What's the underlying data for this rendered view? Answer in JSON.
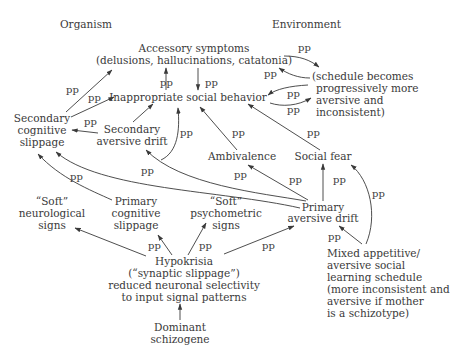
{
  "headers": {
    "organism": "Organism",
    "environment": "Environment"
  },
  "nodes": {
    "accessory_symptoms": [
      "Accessory symptoms",
      "(delusions, hallucinations, catatonia)"
    ],
    "inappropriate_social_behavior": [
      "Inappropriate social behavior"
    ],
    "schedule_becomes": [
      "(schedule becomes",
      "progressively more",
      "aversive and",
      "inconsistent)"
    ],
    "secondary_cognitive_slippage": [
      "Secondary",
      "cognitive",
      "slippage"
    ],
    "secondary_aversive_drift": [
      "Secondary",
      "aversive drift"
    ],
    "ambivalence": [
      "Ambivalence"
    ],
    "social_fear": [
      "Social fear"
    ],
    "soft_neurological_signs": [
      "“Soft”",
      "neurological",
      "signs"
    ],
    "primary_cognitive_slippage": [
      "Primary",
      "cognitive",
      "slippage"
    ],
    "soft_psychometric_signs": [
      "“Soft”",
      "psychometric",
      "signs"
    ],
    "primary_aversive_drift": [
      "Primary",
      "aversive drift"
    ],
    "hypokrisia": [
      "Hypokrisia",
      "(“synaptic slippage”)",
      "reduced neuronal selectivity",
      "to input signal patterns"
    ],
    "mixed_schedule": [
      "Mixed appetitive/",
      "aversive social",
      "learning schedule",
      "(more inconsistent and",
      "aversive if mother",
      "is a schizotype)"
    ],
    "dominant_schizogene": [
      "Dominant",
      "schizogene"
    ]
  },
  "edge_label": "pp",
  "colors": {
    "ink": "#3a3a3a",
    "background": "#ffffff"
  }
}
